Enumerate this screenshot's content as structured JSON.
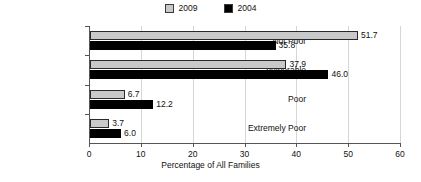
{
  "chart_data": {
    "type": "bar",
    "orientation": "horizontal",
    "title": "",
    "xlabel": "Percentage of All Families",
    "ylabel": "Level of Poverty",
    "categories": [
      "Not Poor",
      "Vulnerable",
      "Poor",
      "Extremely Poor"
    ],
    "series": [
      {
        "name": "2009",
        "color": "#c9c9c9",
        "values": [
          51.7,
          37.9,
          6.7,
          3.7
        ]
      },
      {
        "name": "2004",
        "color": "#000000",
        "values": [
          35.8,
          46.0,
          12.2,
          6.0
        ]
      }
    ],
    "xlim": [
      0,
      60
    ],
    "xticks": [
      0,
      10,
      20,
      30,
      40,
      50,
      60
    ],
    "xtick_labels": [
      "0",
      "10",
      "20",
      "30",
      "40",
      "50",
      "60"
    ],
    "grid": true,
    "legend_position": "top-center",
    "value_labels": [
      "51.7",
      "35.8",
      "37.9",
      "46.0",
      "6.7",
      "12.2",
      "3.7",
      "6.0"
    ]
  },
  "legend": {
    "items": [
      {
        "label": "2009",
        "swatch": "legend-swatch-2009"
      },
      {
        "label": "2004",
        "swatch": "legend-swatch-2004"
      }
    ]
  },
  "axes": {
    "x_title": "Percentage of All Families",
    "y_title": "Level of Poverty"
  }
}
